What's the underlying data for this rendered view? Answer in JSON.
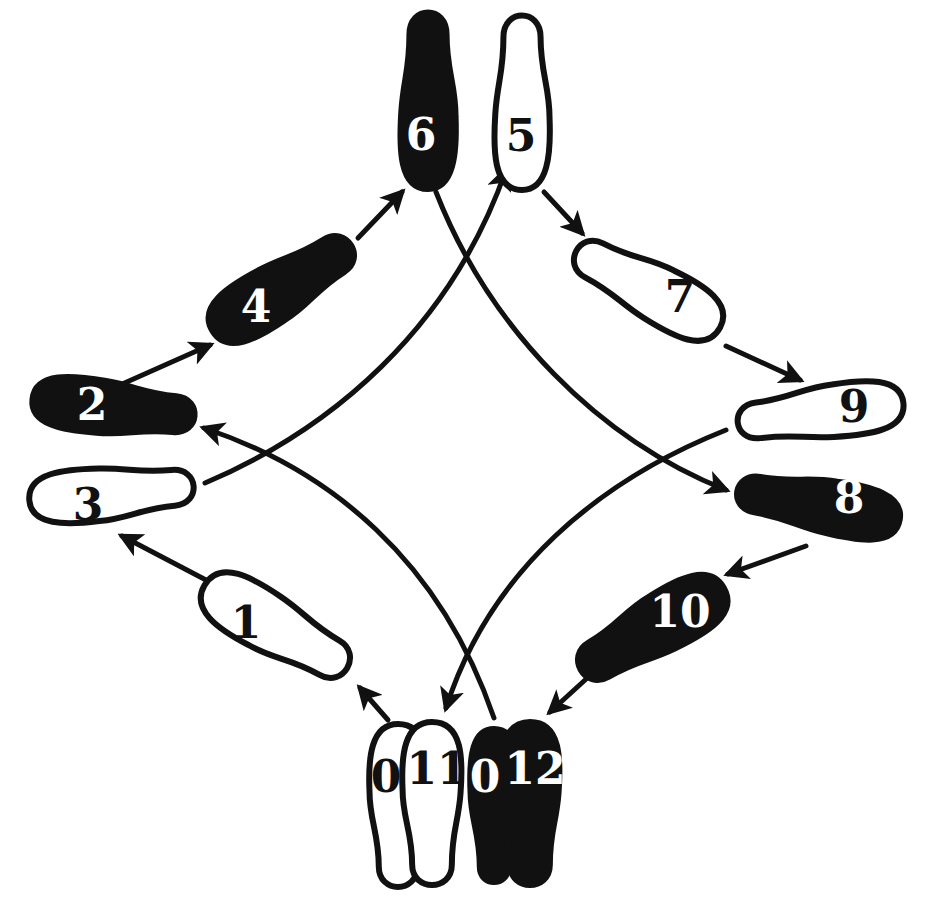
{
  "diagram": {
    "colors": {
      "ink": "#111111",
      "paper": "#ffffff"
    },
    "footprints": [
      {
        "id": "step-1",
        "label": "1",
        "fill": "white",
        "x": 278,
        "y": 628,
        "angle": 210,
        "len": 170,
        "w": 62
      },
      {
        "id": "step-2",
        "label": "2",
        "fill": "black",
        "x": 116,
        "y": 408,
        "angle": 186,
        "len": 168,
        "w": 56
      },
      {
        "id": "step-3",
        "label": "3",
        "fill": "white",
        "x": 114,
        "y": 493,
        "angle": 175,
        "len": 170,
        "w": 56
      },
      {
        "id": "step-4",
        "label": "4",
        "fill": "black",
        "x": 284,
        "y": 287,
        "angle": 148,
        "len": 168,
        "w": 60
      },
      {
        "id": "step-5",
        "label": "5",
        "fill": "white",
        "x": 522,
        "y": 100,
        "angle": 90,
        "len": 180,
        "w": 58
      },
      {
        "id": "step-6",
        "label": "6",
        "fill": "black",
        "x": 428,
        "y": 98,
        "angle": 90,
        "len": 182,
        "w": 58
      },
      {
        "id": "step-7",
        "label": "7",
        "fill": "white",
        "x": 646,
        "y": 288,
        "angle": 28,
        "len": 168,
        "w": 60
      },
      {
        "id": "step-8",
        "label": "8",
        "fill": "black",
        "x": 816,
        "y": 505,
        "angle": 10,
        "len": 170,
        "w": 56
      },
      {
        "id": "step-9",
        "label": "9",
        "fill": "white",
        "x": 818,
        "y": 413,
        "angle": -7,
        "len": 172,
        "w": 56
      },
      {
        "id": "step-10",
        "label": "10",
        "fill": "black",
        "x": 650,
        "y": 630,
        "angle": -30,
        "len": 170,
        "w": 62
      },
      {
        "id": "step-11",
        "label": "11",
        "fill": "white",
        "x": 432,
        "y": 806,
        "angle": -90,
        "len": 168,
        "w": 62
      },
      {
        "id": "step-12",
        "label": "12",
        "fill": "black",
        "x": 530,
        "y": 806,
        "angle": -90,
        "len": 168,
        "w": 62
      }
    ],
    "ghost_footprints": [
      {
        "id": "start-left",
        "label": "0",
        "fill": "white",
        "x": 398,
        "y": 808,
        "angle": -90,
        "len": 168,
        "w": 60
      },
      {
        "id": "start-right",
        "label": "0",
        "fill": "black",
        "x": 494,
        "y": 808,
        "angle": -90,
        "len": 168,
        "w": 60
      }
    ],
    "labels_position_hint": {
      "step-1": [
        246,
        622
      ],
      "step-2": [
        92,
        404
      ],
      "step-3": [
        88,
        504
      ],
      "step-4": [
        256,
        306
      ],
      "step-5": [
        521,
        135
      ],
      "step-6": [
        421,
        134
      ],
      "step-7": [
        680,
        296
      ],
      "step-8": [
        849,
        497
      ],
      "step-9": [
        854,
        406
      ],
      "step-10": [
        680,
        611
      ],
      "step-11": [
        437,
        768
      ],
      "step-12": [
        535,
        768
      ],
      "start-left": [
        386,
        776
      ],
      "start-right": [
        485,
        776
      ]
    }
  }
}
